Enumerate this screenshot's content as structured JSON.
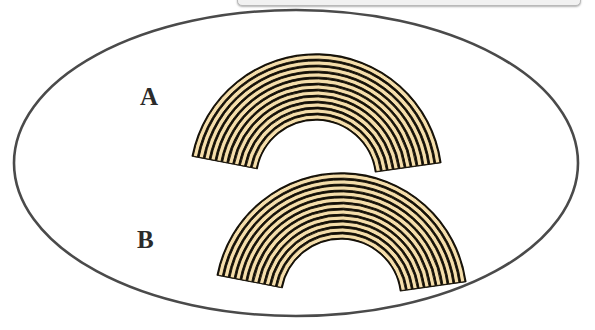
{
  "figure": {
    "background_color": "#ffffff",
    "canvas": {
      "width": 595,
      "height": 330
    }
  },
  "top_panel": {
    "name": "cropped-panel-edge",
    "visible_fragment": "",
    "fill_color": "#f1f1f1",
    "border_color": "#b9b9b9"
  },
  "boundary": {
    "shape": "ellipse",
    "stroke_color": "#4a4a4a",
    "fill_color": "#ffffff",
    "stroke_width": 2.6,
    "center_x": 296,
    "center_y": 163,
    "radius_x": 282,
    "radius_y": 153
  },
  "labels": [
    {
      "id": "A",
      "text": "A",
      "x": 140,
      "y": 84,
      "color": "#2b2b2b",
      "halo_color": "#ffffff"
    },
    {
      "id": "B",
      "text": "B",
      "x": 137,
      "y": 227,
      "color": "#2b2b2b",
      "halo_color": "#ffffff"
    }
  ],
  "arcs": [
    {
      "id": "A",
      "name": "banded-arc-upper",
      "label": "A",
      "center_x": 316,
      "center_y": 180,
      "inner_radius": 60,
      "outer_radius": 126,
      "band_count": 11,
      "start_angle_deg": 191,
      "end_angle_deg": 352,
      "fill_color": "#f5deab",
      "stroke_color": "#141007",
      "stroke_width": 1.5
    },
    {
      "id": "B",
      "name": "banded-arc-lower",
      "label": "B",
      "center_x": 341,
      "center_y": 299,
      "inner_radius": 60,
      "outer_radius": 126,
      "band_count": 11,
      "start_angle_deg": 191,
      "end_angle_deg": 352,
      "fill_color": "#f5deab",
      "stroke_color": "#141007",
      "stroke_width": 1.5
    }
  ],
  "colors": {
    "band_fill": "#f5deab",
    "band_stroke": "#141007",
    "ellipse_stroke": "#4a4a4a",
    "background": "#ffffff",
    "label_text": "#2b2b2b"
  }
}
